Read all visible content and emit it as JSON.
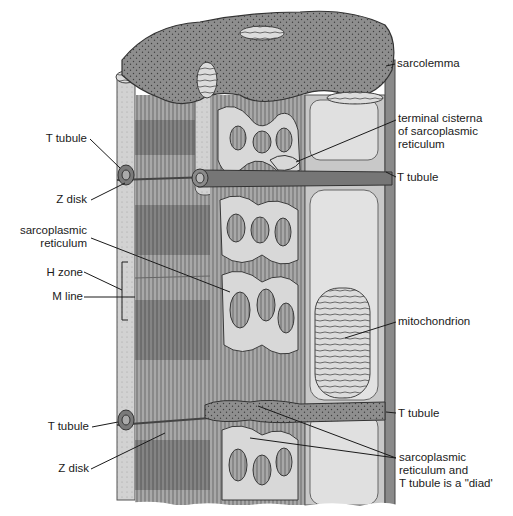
{
  "figure": {
    "colors": {
      "background": "#ffffff",
      "myofibril_light": "#b8b8b8",
      "myofibril_dark": "#7a7a7a",
      "sr_network": "#d9d9d9",
      "sr_outline": "#4a4a4a",
      "sarcoplasm_top": "#8c8c8c",
      "t_tubule": "#6e6e6e",
      "mitochondrion": "#cfcfcf",
      "leader_line": "#1a1a1a"
    }
  },
  "labels_left": [
    {
      "id": "t-tubule-upper",
      "text": "T tubule"
    },
    {
      "id": "z-disk-upper",
      "text": "Z disk"
    },
    {
      "id": "sarcoplasmic-reticulum",
      "text": "sarcoplasmic\nreticulum"
    },
    {
      "id": "h-zone",
      "text": "H zone"
    },
    {
      "id": "m-line",
      "text": "M line"
    },
    {
      "id": "t-tubule-lower",
      "text": "T tubule"
    },
    {
      "id": "z-disk-lower",
      "text": "Z disk"
    }
  ],
  "labels_right": [
    {
      "id": "sarcolemma",
      "text": "sarcolemma"
    },
    {
      "id": "terminal-cisterna",
      "text": "terminal cisterna\nof sarcoplasmic\nreticulum"
    },
    {
      "id": "t-tubule-right-upper",
      "text": "T tubule"
    },
    {
      "id": "mitochondrion",
      "text": "mitochondrion"
    },
    {
      "id": "t-tubule-right-lower",
      "text": "T tubule"
    },
    {
      "id": "diad",
      "text": "sarcoplasmic\nreticulum and\nT tubule is a \"diad'"
    }
  ]
}
